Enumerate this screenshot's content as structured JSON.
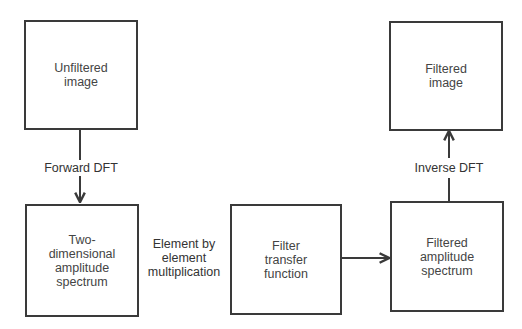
{
  "nodes": {
    "unfiltered_image": "Unfiltered\nimage",
    "amplitude_spectrum": "Two-\ndimensional\namplitude\nspectrum",
    "filter_transfer": "Filter\ntransfer\nfunction",
    "filtered_spectrum": "Filtered\namplitude\nspectrum",
    "filtered_image": "Filtered\nimage"
  },
  "edges": {
    "forward_dft": "Forward DFT",
    "multiplication": "Element by\nelement\nmultiplication",
    "inverse_dft": "Inverse DFT"
  },
  "colors": {
    "stroke": "#3a3a3a"
  }
}
